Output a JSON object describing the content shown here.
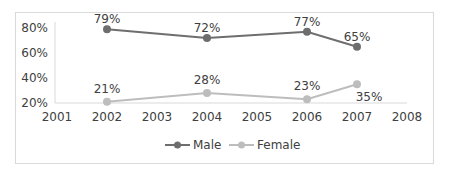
{
  "chart_data": {
    "type": "line",
    "title": "",
    "xlabel": "",
    "ylabel": "",
    "x_ticks": [
      "2001",
      "2002",
      "2003",
      "2004",
      "2005",
      "2006",
      "2007",
      "2008"
    ],
    "y_ticks": [
      "80%",
      "60%",
      "40%",
      "20%"
    ],
    "ylim": [
      20,
      80
    ],
    "xlim": [
      2001,
      2008
    ],
    "grid": false,
    "legend_position": "bottom",
    "series": [
      {
        "name": "Male",
        "color": "#6e6e6e",
        "x": [
          2002,
          2004,
          2006,
          2007
        ],
        "values": [
          79,
          72,
          77,
          65
        ],
        "labels": [
          "79%",
          "72%",
          "77%",
          "65%"
        ]
      },
      {
        "name": "Female",
        "color": "#bdbdbd",
        "x": [
          2002,
          2004,
          2006,
          2007
        ],
        "values": [
          21,
          28,
          23,
          35
        ],
        "labels": [
          "21%",
          "28%",
          "23%",
          "35%"
        ]
      }
    ]
  },
  "legend": {
    "male": "Male",
    "female": "Female"
  }
}
